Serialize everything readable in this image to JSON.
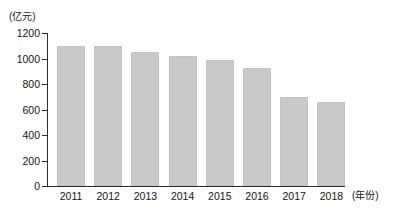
{
  "chart_data": {
    "type": "bar",
    "title": "",
    "subtitle": "",
    "xlabel": "(年份)",
    "ylabel": "(亿元)",
    "categories": [
      "2011",
      "2012",
      "2013",
      "2014",
      "2015",
      "2016",
      "2017",
      "2018"
    ],
    "values": [
      1100,
      1095,
      1050,
      1020,
      985,
      925,
      700,
      660
    ],
    "series": [
      {
        "name": "",
        "values": [
          1100,
          1095,
          1050,
          1020,
          985,
          925,
          700,
          660
        ]
      }
    ],
    "ylim": [
      0,
      1200
    ],
    "ytick_labels": [
      "0",
      "200",
      "400",
      "600",
      "800",
      "1000",
      "1200"
    ],
    "ytick_values": [
      0,
      200,
      400,
      600,
      800,
      1000,
      1200
    ],
    "grid": false,
    "legend": "none",
    "bar_color": "#c9c9c9",
    "axis_color": "#2b2b2b",
    "text_color": "#151515",
    "background": "#ffffff"
  }
}
